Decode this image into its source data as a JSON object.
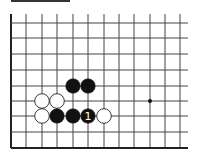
{
  "diagram": {
    "type": "go-board-fragment",
    "colors": {
      "line": "#444444",
      "edge": "#222222",
      "black": "#111111",
      "white": "#ffffff",
      "background": "#ffffff"
    },
    "grid": {
      "x_lines": [
        11,
        26,
        42,
        57,
        73,
        88,
        104,
        119,
        134,
        150,
        165,
        180
      ],
      "y_lines": [
        23,
        38,
        54,
        70,
        86,
        101,
        116,
        132,
        148
      ],
      "right_extent": 188,
      "top_extent": 14
    },
    "star_points": [
      {
        "col": 9,
        "row": 5
      }
    ],
    "stones": [
      {
        "color": "black",
        "col": 4,
        "row": 4
      },
      {
        "color": "black",
        "col": 5,
        "row": 4
      },
      {
        "color": "white",
        "col": 2,
        "row": 5
      },
      {
        "color": "white",
        "col": 3,
        "row": 5
      },
      {
        "color": "white",
        "col": 2,
        "row": 6
      },
      {
        "color": "black",
        "col": 3,
        "row": 6
      },
      {
        "color": "black",
        "col": 4,
        "row": 6
      },
      {
        "color": "black",
        "col": 5,
        "row": 6,
        "label": "1"
      },
      {
        "color": "white",
        "col": 6,
        "row": 6
      }
    ]
  }
}
